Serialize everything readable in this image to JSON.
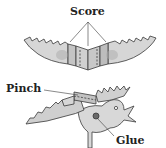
{
  "labels": {
    "score": "Score",
    "pinch": "Pinch",
    "glue": "Glue"
  },
  "colors": {
    "paper": "#d9d9d9",
    "paper_shade": "#b5b5b5",
    "outline": "#3a3a3a",
    "glue_dot": "#6a6a6a",
    "text": "#222222"
  },
  "figures": [
    {
      "name": "folded-wings",
      "description": "Zig-zag edged wing strip with scored fold lines at center"
    },
    {
      "name": "assembled-bird",
      "description": "Bird body with wings pinched on top and glued at body joint"
    }
  ]
}
